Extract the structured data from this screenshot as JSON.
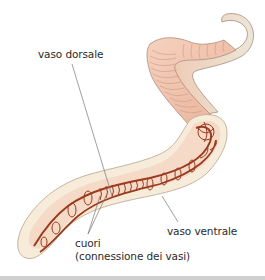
{
  "diagram": {
    "labels": {
      "dorsal_vessel": "vaso dorsale",
      "ventral_vessel": "vaso ventrale",
      "hearts": "cuori",
      "hearts_note": "(connessione dei vasi)"
    },
    "colors": {
      "skin": "#f2c4ad",
      "skin_outline": "#b89080",
      "tail": "#ece4d6",
      "section_fill": "#f7ecda",
      "vessel": "#9b3a1e",
      "leader_line": "#777777",
      "text": "#2a2a2a"
    }
  }
}
